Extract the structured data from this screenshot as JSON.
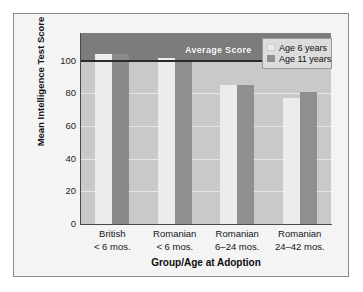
{
  "chart_data": {
    "type": "bar",
    "title": "",
    "xlabel": "Group/Age at Adoption",
    "ylabel": "Mean Intelligence Test Score",
    "ylim": [
      0,
      117
    ],
    "yticks": [
      0,
      20,
      40,
      60,
      80,
      100
    ],
    "ytick_labels": [
      "0",
      "20",
      "40",
      "60",
      "80",
      "100"
    ],
    "grid": true,
    "legend_position": "top-right",
    "categories": [
      "British\n< 6 mos.",
      "Romanian\n< 6 mos.",
      "Romanian\n6–24 mos.",
      "Romanian\n24–42 mos."
    ],
    "category_lines": [
      [
        "British",
        "< 6 mos."
      ],
      [
        "Romanian",
        "< 6 mos."
      ],
      [
        "Romanian",
        "6–24 mos."
      ],
      [
        "Romanian",
        "24–42 mos."
      ]
    ],
    "series": [
      {
        "name": "Age 6 years",
        "color": "#ececec",
        "values": [
          104,
          102,
          85,
          77
        ]
      },
      {
        "name": "Age 11 years",
        "color": "#8f8f8f",
        "values": [
          104,
          100,
          85,
          81
        ]
      }
    ],
    "annotations": [
      {
        "name": "average-score",
        "label": "Average Score",
        "value": 100
      }
    ]
  },
  "legend": {
    "items": [
      {
        "label": "Age 6 years",
        "swatch": "series-0-swatch"
      },
      {
        "label": "Age 11 years",
        "swatch": "series-1-swatch"
      }
    ]
  },
  "colors": {
    "plot_lower_band": "#c9c9c9",
    "plot_upper_band": "#7c7c7c",
    "average_line": "#2b2b2b",
    "series_0": "#ececec",
    "series_1": "#8f8f8f",
    "card_background": "#f4f4f4",
    "gridline": "#e6e6e6"
  }
}
